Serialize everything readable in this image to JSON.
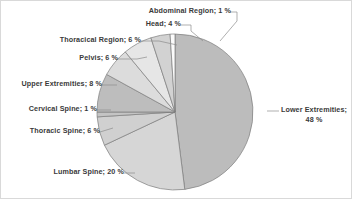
{
  "chart_data": {
    "type": "pie",
    "title": "",
    "subtitle": "",
    "xlabel": "",
    "ylabel": "",
    "legend_position": "none",
    "grid": false,
    "label_format": "name; value %",
    "unit": "%",
    "categories": [
      "Lower Extremities",
      "Lumbar Spine",
      "Thoracic Spine",
      "Cervical Spine",
      "Upper Extremities",
      "Pelvis",
      "Thoracical Region",
      "Head",
      "Abdominal Region"
    ],
    "values": [
      48,
      20,
      6,
      1,
      8,
      6,
      6,
      4,
      1
    ],
    "slices": [
      {
        "name": "Lower Extremities",
        "value": 48,
        "label": "Lower Extremities;",
        "label_line2": "48 %",
        "color": "#bcbcbc",
        "start_angle": 0,
        "end_angle": 172.8
      },
      {
        "name": "Lumbar Spine",
        "value": 20,
        "label": "Lumbar Spine; 20 %",
        "color": "#d6d6d6",
        "start_angle": 172.8,
        "end_angle": 244.8
      },
      {
        "name": "Thoracic Spine",
        "value": 6,
        "label": "Thoracic Spine; 6 %",
        "color": "#d0d0d0",
        "start_angle": 244.8,
        "end_angle": 266.4
      },
      {
        "name": "Cervical Spine",
        "value": 1,
        "label": "Cervical Spine; 1 %",
        "color": "#c4c4c4",
        "start_angle": 266.4,
        "end_angle": 270.0
      },
      {
        "name": "Upper Extremities",
        "value": 8,
        "label": "Upper Extremities; 8 %",
        "color": "#bdbdbd",
        "start_angle": 270.0,
        "end_angle": 298.8
      },
      {
        "name": "Pelvis",
        "value": 6,
        "label": "Pelvis; 6 %",
        "color": "#dcdcdc",
        "start_angle": 298.8,
        "end_angle": 320.4
      },
      {
        "name": "Thoracical Region",
        "value": 6,
        "label": "Thoracical Region; 6 %",
        "color": "#e6e6e6",
        "start_angle": 320.4,
        "end_angle": 342.0
      },
      {
        "name": "Head",
        "value": 4,
        "label": "Head; 4 %",
        "color": "#d2d2d2",
        "start_angle": 342.0,
        "end_angle": 356.4
      },
      {
        "name": "Abdominal Region",
        "value": 1,
        "label": "Abdominal Region; 1 %",
        "color": "#fbfbfb",
        "start_angle": 356.4,
        "end_angle": 360.0
      }
    ]
  },
  "geometry": {
    "center_x": 174,
    "center_y": 111,
    "radius": 78
  },
  "style": {
    "slice_outline": "#7d7d7d",
    "leader_line": "#8c8c8c",
    "text_color": "#3a3a3a",
    "background": "#ffffff",
    "frame_border": "#d9d9d9"
  }
}
